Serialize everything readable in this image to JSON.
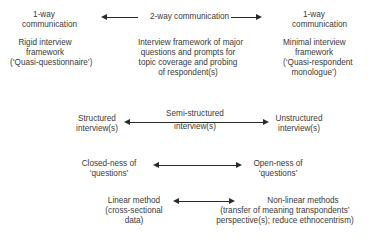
{
  "diagram": {
    "row1": {
      "left": {
        "heading": [
          "1-way",
          "communication"
        ],
        "body": [
          "Rigid interview",
          "framework",
          "(‘Quasi-questionnaire’)"
        ]
      },
      "center": {
        "heading": "2-way communication",
        "body": [
          "Interview framework of major",
          "questions and prompts for",
          "topic coverage and probing",
          "of respondent(s)"
        ]
      },
      "right": {
        "heading": [
          "1-way",
          "communication"
        ],
        "body": [
          "Minimal interview",
          "framework",
          "(‘Quasi-respondent",
          "monologue’)"
        ]
      }
    },
    "row2": {
      "left": [
        "Structured",
        "interview(s)"
      ],
      "center": [
        "Semi-structured",
        "interview(s)"
      ],
      "right": [
        "Unstructured",
        "interview(s)"
      ]
    },
    "row3": {
      "left": [
        "Closed-ness of",
        "‘questions’"
      ],
      "right": [
        "Open-ness of",
        "‘questions’"
      ]
    },
    "row4": {
      "left": [
        "Linear method",
        "(cross-sectional",
        "data)"
      ],
      "right": [
        "Non-linear methods",
        "(transfer of meaning transpondents’",
        "perspective(s); reduce ethnocentrism)"
      ]
    }
  }
}
